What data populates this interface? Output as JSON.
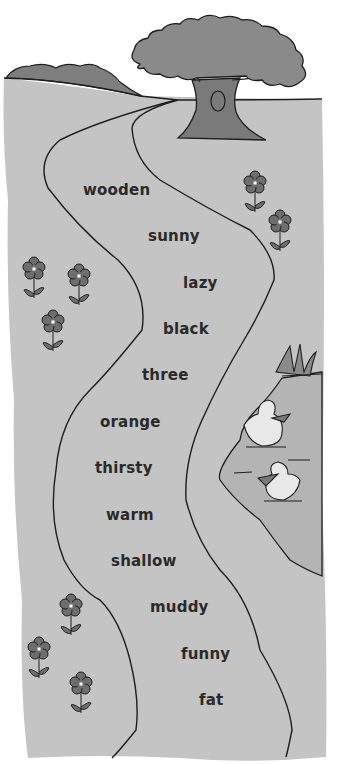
{
  "colors": {
    "ground": "#c4c4c4",
    "pond": "#b4b4b4",
    "tree_canopy": "#8a8a8a",
    "tree_trunk": "#7a7a7a",
    "hills": "#7e7e7e",
    "flower": "#6e6e6e",
    "outline": "#1e1e1e",
    "duck": "#e8e8e8",
    "text": "#2a2a2a"
  },
  "path_words": [
    {
      "text": "wooden",
      "x": 83,
      "y": 181
    },
    {
      "text": "sunny",
      "x": 148,
      "y": 227
    },
    {
      "text": "lazy",
      "x": 183,
      "y": 274
    },
    {
      "text": "black",
      "x": 163,
      "y": 320
    },
    {
      "text": "three",
      "x": 142,
      "y": 366
    },
    {
      "text": "orange",
      "x": 100,
      "y": 413
    },
    {
      "text": "thirsty",
      "x": 95,
      "y": 459
    },
    {
      "text": "warm",
      "x": 106,
      "y": 506
    },
    {
      "text": "shallow",
      "x": 111,
      "y": 552
    },
    {
      "text": "muddy",
      "x": 150,
      "y": 598
    },
    {
      "text": "funny",
      "x": 181,
      "y": 645
    },
    {
      "text": "fat",
      "x": 199,
      "y": 691
    }
  ],
  "elements": {
    "tree": "oak-tree",
    "hills": "distant-hills",
    "pond": "pond-with-reeds",
    "ducks": 2,
    "flowers": 9
  }
}
